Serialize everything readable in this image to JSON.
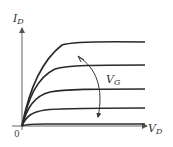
{
  "diagram": {
    "y_axis": {
      "label_main": "I",
      "label_sub": "D"
    },
    "x_axis": {
      "label_main": "V",
      "label_sub": "D"
    },
    "origin_label": "0",
    "parameter_label": {
      "main": "V",
      "sub": "G"
    },
    "curve_count": 5,
    "colors": {
      "curve": "#2a2a2a",
      "axis": "#555555",
      "text": "#333333"
    }
  }
}
